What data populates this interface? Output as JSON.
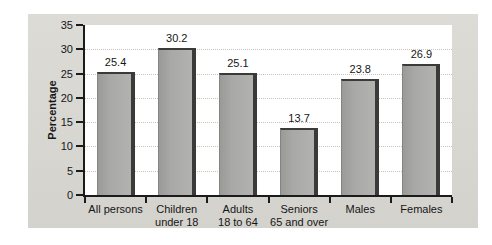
{
  "chart_data": {
    "type": "bar",
    "title": "",
    "xlabel": "",
    "ylabel": "Percentage",
    "categories": [
      "All persons",
      "Children under 18",
      "Adults 18 to 64",
      "Seniors 65 and over",
      "Males",
      "Females"
    ],
    "category_lines": [
      [
        "All persons"
      ],
      [
        "Children",
        "under 18"
      ],
      [
        "Adults",
        "18 to 64"
      ],
      [
        "Seniors",
        "65 and over"
      ],
      [
        "Males"
      ],
      [
        "Females"
      ]
    ],
    "values": [
      25.4,
      30.2,
      25.1,
      13.7,
      23.8,
      26.9
    ],
    "value_labels": [
      "25.4",
      "30.2",
      "25.1",
      "13.7",
      "23.8",
      "26.9"
    ],
    "ylim": [
      0,
      35
    ],
    "ytick_step": 5,
    "ytick_labels": [
      "0",
      "5",
      "10",
      "15",
      "20",
      "25",
      "30",
      "35"
    ],
    "gridlines_at": [
      5,
      10,
      15,
      20,
      25,
      30
    ],
    "grid": "horizontal-dotted",
    "legend": "none",
    "colors": {
      "bar_fill": "#a8a8a6",
      "bar_shadow": "#3a3a38",
      "panel_background": "#d7d6d1",
      "plot_background": "#ffffff",
      "gridline": "#c7c3bb",
      "axis": "#1b1b1b",
      "text": "#161616"
    }
  }
}
